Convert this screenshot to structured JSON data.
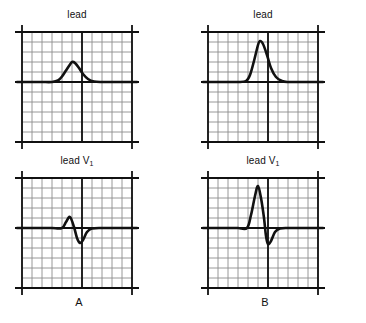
{
  "figure": {
    "background": "#ffffff",
    "ink_color": "#111111",
    "grid_minor_color": "#8c8c8c",
    "grid_major_color": "#111111",
    "trace_color": "#111111"
  },
  "groups": [
    {
      "id": "A",
      "label": "A"
    },
    {
      "id": "B",
      "label": "B"
    }
  ],
  "panels": [
    {
      "id": "a-lead-ii",
      "group": "A",
      "lead_text": "lead II",
      "lead_name": "lead",
      "lead_sub": "",
      "has_sub": false,
      "position": {
        "x": 22,
        "y": 32,
        "w": 114,
        "h": 110
      },
      "grid": {
        "cols": 11,
        "rows": 11,
        "cell": 10,
        "baseline_row": 5
      },
      "waveform_description": "broad low-amplitude rounded P wave on flat baseline"
    },
    {
      "id": "a-lead-v1",
      "group": "A",
      "lead_text": "lead V1",
      "lead_name": "lead V",
      "lead_sub": "1",
      "has_sub": true,
      "position": {
        "x": 22,
        "y": 178,
        "w": 114,
        "h": 110
      },
      "grid": {
        "cols": 11,
        "rows": 11,
        "cell": 10,
        "baseline_row": 5
      },
      "waveform_description": "small biphasic rS deflection: small upward r then small downward s"
    },
    {
      "id": "b-lead-ii",
      "group": "B",
      "lead_text": "lead II",
      "lead_name": "lead",
      "lead_sub": "",
      "has_sub": false,
      "position": {
        "x": 208,
        "y": 32,
        "w": 114,
        "h": 110
      },
      "grid": {
        "cols": 11,
        "rows": 11,
        "cell": 10,
        "baseline_row": 5
      },
      "waveform_description": "tall narrow peaked P wave on flat baseline"
    },
    {
      "id": "b-lead-v1",
      "group": "B",
      "lead_text": "lead V1",
      "lead_name": "lead V",
      "lead_sub": "1",
      "has_sub": true,
      "position": {
        "x": 208,
        "y": 178,
        "w": 114,
        "h": 110
      },
      "grid": {
        "cols": 11,
        "rows": 11,
        "cell": 10,
        "baseline_row": 5
      },
      "waveform_description": "tall upward R wave followed by deeper downward S wave"
    }
  ],
  "group_labels": [
    {
      "text": "A",
      "x": 22,
      "y": 296,
      "w": 114
    },
    {
      "text": "B",
      "x": 208,
      "y": 296,
      "w": 114
    }
  ],
  "chart_data": {
    "type": "line",
    "title": "",
    "xlabel": "",
    "ylabel": "",
    "grid": true,
    "legend": "none",
    "note": "Four ECG tracings on standard graph paper; amplitudes given in grid small-squares relative to the isoelectric baseline, time in small-squares from the left edge of each grid.",
    "axis_units": {
      "x": "small squares (10 px)",
      "y": "small squares (10 px)"
    },
    "xlim": [
      0,
      11
    ],
    "ylim": [
      -5,
      6
    ],
    "panels": [
      {
        "name": "A - lead II",
        "baseline": 0,
        "peak_amplitude": 2.0,
        "peak_x": 5.0,
        "trough_amplitude": 0,
        "x": [
          0,
          1,
          2,
          3,
          3.6,
          4.0,
          4.4,
          4.8,
          5.0,
          5.3,
          5.7,
          6.1,
          6.6,
          7.2,
          8,
          9,
          10,
          11
        ],
        "y": [
          0,
          0,
          0,
          0,
          0.15,
          0.55,
          1.15,
          1.75,
          2.0,
          1.9,
          1.4,
          0.8,
          0.3,
          0.05,
          0,
          0,
          0,
          0
        ]
      },
      {
        "name": "A - lead V1",
        "baseline": 0,
        "peak_amplitude": 1.1,
        "peak_x": 4.8,
        "trough_amplitude": -1.5,
        "trough_x": 5.7,
        "x": [
          0,
          1,
          2,
          3,
          4.0,
          4.4,
          4.8,
          5.2,
          5.5,
          5.8,
          6.1,
          6.5,
          7.0,
          8,
          9,
          10,
          11
        ],
        "y": [
          0,
          0,
          0,
          0,
          0,
          0.6,
          1.1,
          0.1,
          -1.0,
          -1.5,
          -1.2,
          -0.4,
          -0.05,
          0,
          0,
          0,
          0
        ]
      },
      {
        "name": "B - lead II",
        "baseline": 0,
        "peak_amplitude": 4.1,
        "peak_x": 5.2,
        "trough_amplitude": 0,
        "x": [
          0,
          1,
          2,
          3,
          3.8,
          4.2,
          4.6,
          5.0,
          5.2,
          5.5,
          5.9,
          6.3,
          6.8,
          7.4,
          8,
          9,
          10,
          11
        ],
        "y": [
          0,
          0,
          0,
          0,
          0.1,
          0.7,
          2.1,
          3.7,
          4.1,
          3.8,
          2.7,
          1.4,
          0.5,
          0.1,
          0,
          0,
          0,
          0
        ]
      },
      {
        "name": "B - lead V1",
        "baseline": 0,
        "peak_amplitude": 4.2,
        "peak_x": 5.0,
        "trough_amplitude": -1.6,
        "trough_x": 6.0,
        "x": [
          0,
          1,
          2,
          3,
          3.9,
          4.3,
          4.7,
          5.0,
          5.3,
          5.6,
          5.8,
          6.0,
          6.3,
          6.7,
          7.2,
          8,
          9,
          10,
          11
        ],
        "y": [
          0,
          0,
          0,
          0,
          0,
          1.3,
          3.2,
          4.2,
          3.0,
          1.0,
          -0.8,
          -1.6,
          -1.3,
          -0.4,
          -0.05,
          0,
          0,
          0,
          0
        ]
      }
    ]
  }
}
